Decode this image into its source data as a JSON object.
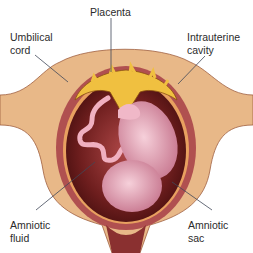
{
  "diagram": {
    "labels": {
      "placenta": "Placenta",
      "umbilical_cord_1": "Umbilical",
      "umbilical_cord_2": "cord",
      "intrauterine_1": "Intrauterine",
      "intrauterine_2": "cavity",
      "amniotic_fluid_1": "Amniotic",
      "amniotic_fluid_2": "fluid",
      "amniotic_sac_1": "Amniotic",
      "amniotic_sac_2": "sac"
    },
    "colors": {
      "uterine_wall": "#e8b888",
      "muscle_layer": "#b05050",
      "cavity": "#6e1e1e",
      "placenta": "#f0c040",
      "fetus": "#e8a8b8",
      "leader_line": "#404858"
    }
  }
}
